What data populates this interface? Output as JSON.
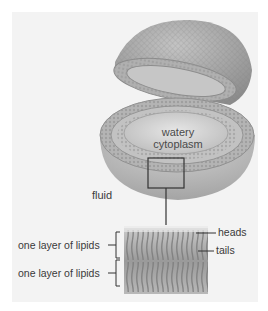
{
  "diagram": {
    "labels": {
      "interior": "watery",
      "interior_line2": "cytoplasm",
      "exterior": "fluid",
      "layer_top": "one layer of lipids",
      "layer_bottom": "one layer of lipids",
      "heads": "heads",
      "tails": "tails"
    },
    "colors": {
      "background": "#ffffff",
      "panel": "#f3f3f3",
      "sphere": "#a9a9a9",
      "cytoplasm": "#d6d6d6",
      "leader_line": "#333333"
    }
  }
}
